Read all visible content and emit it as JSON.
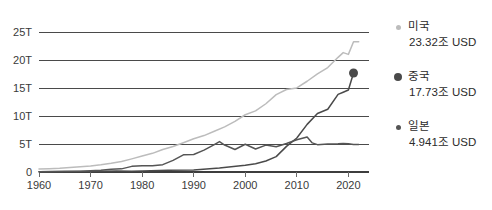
{
  "chart_data": {
    "type": "line",
    "title": "",
    "subtitle": "",
    "xlabel": "",
    "ylabel": "",
    "xlim": [
      1960,
      2024
    ],
    "ylim": [
      0,
      26.5
    ],
    "grid": true,
    "legend_position": "right",
    "y_ticks": [
      {
        "value": 25,
        "label": "25T"
      },
      {
        "value": 20,
        "label": "20T"
      },
      {
        "value": 15,
        "label": "15T"
      },
      {
        "value": 10,
        "label": "10T"
      },
      {
        "value": 5,
        "label": "5T"
      },
      {
        "value": 0,
        "label": "0"
      }
    ],
    "x_ticks": [
      {
        "value": 1960,
        "label": "1960"
      },
      {
        "value": 1970,
        "label": "1970"
      },
      {
        "value": 1980,
        "label": "1980"
      },
      {
        "value": 1990,
        "label": "1990"
      },
      {
        "value": 2000,
        "label": "2000"
      },
      {
        "value": 2010,
        "label": "2010"
      },
      {
        "value": 2020,
        "label": "2020"
      }
    ],
    "unit_note": "T",
    "series": [
      {
        "name": "미국",
        "legend_label": "미국",
        "value_label": "23.32조 USD",
        "final_value": 23.32,
        "color": "#bcbcbc",
        "marker": false,
        "marker_size": 4,
        "x": [
          1960,
          1962,
          1964,
          1966,
          1968,
          1970,
          1972,
          1974,
          1976,
          1978,
          1980,
          1982,
          1984,
          1986,
          1988,
          1990,
          1992,
          1994,
          1996,
          1998,
          2000,
          2002,
          2004,
          2006,
          2008,
          2010,
          2012,
          2014,
          2016,
          2018,
          2019,
          2020,
          2021,
          2022
        ],
        "values": [
          0.54,
          0.6,
          0.69,
          0.82,
          0.94,
          1.07,
          1.28,
          1.55,
          1.87,
          2.35,
          2.86,
          3.34,
          4.04,
          4.58,
          5.25,
          5.96,
          6.52,
          7.29,
          8.07,
          9.06,
          10.25,
          10.94,
          12.22,
          13.86,
          14.77,
          15.05,
          16.25,
          17.55,
          18.7,
          20.53,
          21.38,
          21.06,
          23.32,
          23.32
        ]
      },
      {
        "name": "중국",
        "legend_label": "중국",
        "value_label": "17.73조 USD",
        "final_value": 17.73,
        "color": "#4a4a4a",
        "marker": true,
        "marker_size": 9,
        "x": [
          1960,
          1965,
          1970,
          1975,
          1978,
          1980,
          1985,
          1990,
          1995,
          2000,
          2002,
          2004,
          2006,
          2008,
          2010,
          2012,
          2014,
          2016,
          2018,
          2019,
          2020,
          2021
        ],
        "values": [
          0.06,
          0.07,
          0.09,
          0.16,
          0.15,
          0.19,
          0.31,
          0.36,
          0.73,
          1.21,
          1.47,
          1.96,
          2.75,
          4.59,
          6.09,
          8.53,
          10.48,
          11.23,
          13.89,
          14.28,
          14.69,
          17.73
        ]
      },
      {
        "name": "일본",
        "legend_label": "일본",
        "value_label": "4.941조 USD",
        "final_value": 4.941,
        "color": "#555555",
        "marker": false,
        "marker_size": 4,
        "x": [
          1960,
          1964,
          1968,
          1970,
          1972,
          1974,
          1976,
          1978,
          1980,
          1982,
          1984,
          1986,
          1988,
          1990,
          1992,
          1994,
          1995,
          1996,
          1998,
          2000,
          2002,
          2004,
          2006,
          2008,
          2010,
          2012,
          2013,
          2014,
          2016,
          2018,
          2019,
          2020,
          2021,
          2022
        ],
        "values": [
          0.044,
          0.081,
          0.147,
          0.213,
          0.317,
          0.48,
          0.56,
          1.01,
          1.11,
          1.13,
          1.32,
          2.08,
          3.07,
          3.13,
          3.91,
          4.91,
          5.45,
          4.83,
          4.03,
          4.97,
          4.12,
          4.82,
          4.53,
          5.11,
          5.76,
          6.27,
          5.21,
          4.9,
          5.0,
          5.04,
          5.12,
          5.06,
          4.941,
          4.941
        ]
      }
    ]
  },
  "legend": {
    "items": [
      {
        "name": "미국",
        "value": "23.32조 USD"
      },
      {
        "name": "중국",
        "value": "17.73조 USD"
      },
      {
        "name": "일본",
        "value": "4.941조 USD"
      }
    ]
  },
  "watermark": {
    "text": ""
  }
}
